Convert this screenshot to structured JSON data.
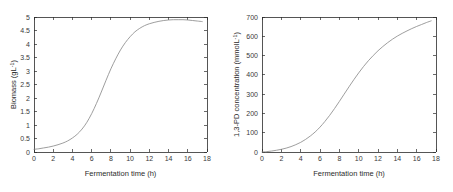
{
  "figure": {
    "background": "#ffffff",
    "line_color": "#8c8c8c",
    "axis_color": "#2b2b2b"
  },
  "chart_data": [
    {
      "type": "line",
      "panel": "left",
      "title": "",
      "xlabel": "Fermentation time (h)",
      "ylabel": "Biomass (gL",
      "ylabel_sup": "-1",
      "ylabel_tail": ")",
      "ylabel_full": "Biomass (gL⁻¹)",
      "xlim": [
        0,
        18
      ],
      "ylim": [
        0,
        5
      ],
      "xticks": [
        "0",
        "2",
        "4",
        "6",
        "8",
        "10",
        "12",
        "14",
        "16",
        "18"
      ],
      "xtick_values": [
        0,
        2,
        4,
        6,
        8,
        10,
        12,
        14,
        16,
        18
      ],
      "yticks": [
        "0",
        "0.5",
        "1",
        "1.5",
        "2",
        "2.5",
        "3",
        "3.5",
        "4",
        "4.5",
        "5"
      ],
      "ytick_values": [
        0,
        0.5,
        1,
        1.5,
        2,
        2.5,
        3,
        3.5,
        4,
        4.5,
        5
      ],
      "grid": false,
      "legend": null,
      "x": [
        0,
        0.5,
        1,
        1.5,
        2,
        2.5,
        3,
        3.5,
        4,
        4.5,
        5,
        5.5,
        6,
        6.5,
        7,
        7.5,
        8,
        8.5,
        9,
        9.5,
        10,
        10.5,
        11,
        11.5,
        12,
        12.5,
        13,
        13.5,
        14,
        14.5,
        15,
        15.5,
        16,
        16.5,
        17,
        17.5
      ],
      "values": [
        0.1,
        0.12,
        0.15,
        0.18,
        0.22,
        0.27,
        0.33,
        0.41,
        0.52,
        0.66,
        0.85,
        1.1,
        1.42,
        1.8,
        2.22,
        2.66,
        3.08,
        3.45,
        3.78,
        4.05,
        4.27,
        4.45,
        4.58,
        4.68,
        4.75,
        4.8,
        4.84,
        4.87,
        4.89,
        4.9,
        4.9,
        4.9,
        4.89,
        4.87,
        4.85,
        4.83
      ]
    },
    {
      "type": "line",
      "panel": "right",
      "title": "",
      "xlabel": "Fermentation time (h)",
      "ylabel": "1,3-PD concentration (mmolL",
      "ylabel_sup": "-1",
      "ylabel_tail": ")",
      "ylabel_full": "1,3-PD concentration (mmolL⁻¹)",
      "xlim": [
        0,
        18
      ],
      "ylim": [
        0,
        700
      ],
      "xticks": [
        "0",
        "2",
        "4",
        "6",
        "8",
        "10",
        "12",
        "14",
        "16",
        "18"
      ],
      "xtick_values": [
        0,
        2,
        4,
        6,
        8,
        10,
        12,
        14,
        16,
        18
      ],
      "yticks": [
        "0",
        "100",
        "200",
        "300",
        "400",
        "500",
        "600",
        "700"
      ],
      "ytick_values": [
        0,
        100,
        200,
        300,
        400,
        500,
        600,
        700
      ],
      "grid": false,
      "legend": null,
      "x": [
        0,
        0.5,
        1,
        1.5,
        2,
        2.5,
        3,
        3.5,
        4,
        4.5,
        5,
        5.5,
        6,
        6.5,
        7,
        7.5,
        8,
        8.5,
        9,
        9.5,
        10,
        10.5,
        11,
        11.5,
        12,
        12.5,
        13,
        13.5,
        14,
        14.5,
        15,
        15.5,
        16,
        16.5,
        17,
        17.5
      ],
      "values": [
        0,
        2,
        5,
        9,
        14,
        20,
        28,
        38,
        50,
        65,
        83,
        104,
        129,
        158,
        190,
        225,
        262,
        300,
        338,
        375,
        410,
        443,
        473,
        500,
        525,
        547,
        567,
        585,
        601,
        615,
        628,
        640,
        651,
        661,
        671,
        680
      ]
    }
  ]
}
